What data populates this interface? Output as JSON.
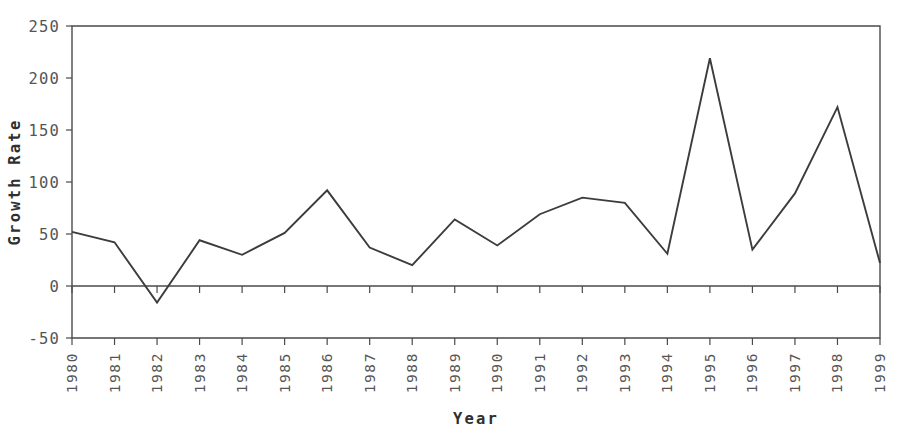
{
  "chart_data": {
    "type": "line",
    "title": "",
    "xlabel": "Year",
    "ylabel": "Growth Rate",
    "categories": [
      "1980",
      "1981",
      "1982",
      "1983",
      "1984",
      "1985",
      "1986",
      "1987",
      "1988",
      "1989",
      "1990",
      "1991",
      "1992",
      "1993",
      "1994",
      "1995",
      "1996",
      "1997",
      "1998",
      "1999"
    ],
    "values": [
      52,
      42,
      -16,
      44,
      30,
      51,
      92,
      37,
      20,
      64,
      39,
      69,
      85,
      80,
      31,
      219,
      35,
      89,
      172,
      22
    ],
    "series": [
      {
        "name": "Growth Rate",
        "values": [
          52,
          42,
          -16,
          44,
          30,
          51,
          92,
          37,
          20,
          64,
          39,
          69,
          85,
          80,
          31,
          219,
          35,
          89,
          172,
          22
        ]
      }
    ],
    "ylim": [
      -50,
      250
    ],
    "ytick_labels": [
      "250",
      "200",
      "150",
      "100",
      "50",
      "0",
      "-50"
    ],
    "ytick_values": [
      250,
      200,
      150,
      100,
      50,
      0,
      -50
    ],
    "xlim": [
      "1980",
      "1999"
    ],
    "grid": false,
    "legend": "none",
    "zero_line": true,
    "line_color": "#3c3c3c",
    "axis_color": "#4a4a4a",
    "background_color": "#ffffff",
    "xtick_rotation": -90
  },
  "labels": {
    "x_axis_title": "Year",
    "y_axis_title": "Growth Rate"
  }
}
